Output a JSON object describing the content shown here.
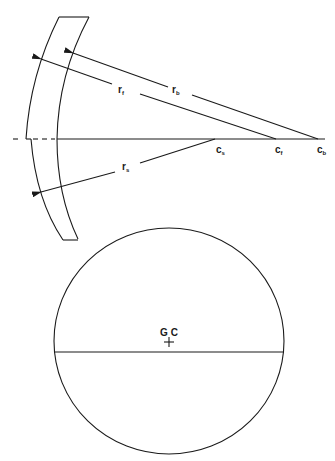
{
  "diagram": {
    "lens_section": {
      "radii": [
        {
          "id": "r_f",
          "label": "r",
          "subscript": "f"
        },
        {
          "id": "r_b",
          "label": "r",
          "subscript": "b"
        },
        {
          "id": "r_s",
          "label": "r",
          "subscript": "s"
        }
      ],
      "centers": [
        {
          "id": "c_s",
          "label": "c",
          "subscript": "s"
        },
        {
          "id": "c_f",
          "label": "c",
          "subscript": "f"
        },
        {
          "id": "c_b",
          "label": "c",
          "subscript": "b"
        }
      ]
    },
    "lens_front_view": {
      "center_label": "G C",
      "center_marker": "+"
    }
  }
}
